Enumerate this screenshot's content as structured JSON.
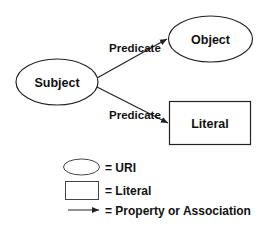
{
  "diagram": {
    "nodes": {
      "subject": {
        "label": "Subject",
        "shape": "ellipse"
      },
      "object": {
        "label": "Object",
        "shape": "ellipse"
      },
      "literal": {
        "label": "Literal",
        "shape": "rectangle"
      }
    },
    "edges": [
      {
        "from": "Subject",
        "to": "Object",
        "label": "Predicate"
      },
      {
        "from": "Subject",
        "to": "Literal",
        "label": "Predicate"
      }
    ]
  },
  "legend": {
    "items": [
      {
        "symbol": "ellipse",
        "text": "= URI"
      },
      {
        "symbol": "rectangle",
        "text": "= Literal"
      },
      {
        "symbol": "arrow",
        "text": "= Property or Association"
      }
    ]
  },
  "colors": {
    "stroke": "#222222",
    "text": "#111111",
    "background": "#ffffff"
  }
}
